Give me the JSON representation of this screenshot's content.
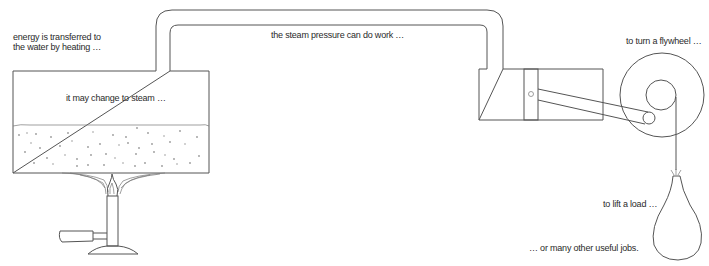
{
  "diagram": {
    "labels": {
      "heating_line1": "energy is transferred to",
      "heating_line2": "the water by heating …",
      "steam": "it may change to steam …",
      "pressure": "the steam pressure can do work …",
      "flywheel": "to turn a flywheel …",
      "load": "to lift a load …",
      "jobs": "… or many other useful jobs."
    },
    "components": [
      {
        "name": "boiler",
        "icon": "boiler-tank"
      },
      {
        "name": "bunsen-burner",
        "icon": "burner-flame"
      },
      {
        "name": "steam-pipe",
        "icon": "pipe"
      },
      {
        "name": "cylinder-with-piston",
        "icon": "piston"
      },
      {
        "name": "connecting-rod",
        "icon": "rod"
      },
      {
        "name": "flywheel",
        "icon": "wheel"
      },
      {
        "name": "load-bag",
        "icon": "weight-sack"
      }
    ],
    "colors": {
      "line": "#555555",
      "text": "#2a2a2a",
      "background": "#ffffff"
    }
  }
}
